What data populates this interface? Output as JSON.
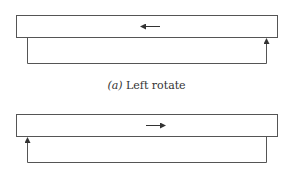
{
  "diagrams": [
    {
      "id": "a",
      "caption_label": "(a)",
      "caption_text": "Left rotate",
      "shift_direction": "left",
      "return_path": "right-to-left: exits bottom-left, re-enters bottom-right"
    },
    {
      "id": "b",
      "caption_label": "",
      "caption_text": "",
      "shift_direction": "right",
      "return_path": "left-to-right: exits bottom-right, re-enters bottom-left"
    }
  ],
  "colors": {
    "line": "#555555",
    "background": "#ffffff"
  }
}
